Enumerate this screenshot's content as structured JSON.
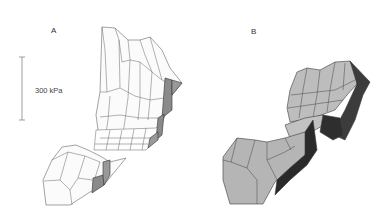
{
  "figure": {
    "panels": [
      {
        "id": "A",
        "label": "A",
        "style": "wireframe",
        "fill": "#ffffff",
        "edge": "#555555",
        "shadow": "#7a7a7a"
      },
      {
        "id": "B",
        "label": "B",
        "style": "shaded",
        "fill": "#b8b8b8",
        "edge": "#3a3a3a",
        "shadow": "#2a2a2a"
      }
    ],
    "scale_bar": {
      "label": "300 kPa"
    }
  }
}
